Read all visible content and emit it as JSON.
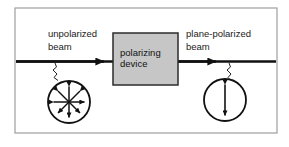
{
  "figure": {
    "frame": {
      "border_color": "#9a9a9a",
      "background_color": "#ffffff"
    },
    "labels": {
      "left_beam_line1": "unpolarized",
      "left_beam_line2": "beam",
      "right_beam_line1": "plane-polarized",
      "right_beam_line2": "beam",
      "device_line1": "polarizing",
      "device_line2": "device"
    },
    "device_box": {
      "fill_color": "#c6c6c6",
      "border_color": "#2b2b2b"
    },
    "beam": {
      "color": "#111111",
      "direction": "left-to-right"
    },
    "left_circle": {
      "name": "unpolarized-cross-section",
      "arrow_count": 8,
      "arrow_style": "double-headed",
      "orientations_deg": [
        0,
        45,
        90,
        135,
        180,
        225,
        270,
        315
      ],
      "stroke_color": "#111111"
    },
    "right_circle": {
      "name": "plane-polarized-cross-section",
      "arrow_count": 1,
      "arrow_style": "double-headed",
      "orientations_deg": [
        90
      ],
      "stroke_color": "#111111"
    }
  }
}
